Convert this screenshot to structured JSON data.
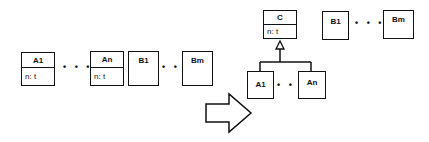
{
  "left": {
    "classes": [
      {
        "name": "A1",
        "attr": "n: t"
      },
      {
        "name": "An",
        "attr": "n: t"
      },
      {
        "name": "B1"
      },
      {
        "name": "Bm"
      }
    ],
    "ellipsis": "• • •"
  },
  "right": {
    "superclass": {
      "name": "C",
      "attr": "n: t"
    },
    "subclasses": [
      {
        "name": "A1"
      },
      {
        "name": "An"
      }
    ],
    "others": [
      {
        "name": "B1"
      },
      {
        "name": "Bm"
      }
    ],
    "ellipsis": "• • •"
  },
  "transform_arrow": "right-arrow"
}
